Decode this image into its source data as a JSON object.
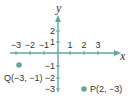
{
  "diagram": {
    "type": "coordinate-plane",
    "axes": {
      "x_label": "x",
      "y_label": "y",
      "x_ticks": [
        {
          "value": -3,
          "label": "−3"
        },
        {
          "value": -2,
          "label": "−2"
        },
        {
          "value": -1,
          "label": "−1"
        },
        {
          "value": 1,
          "label": "1"
        },
        {
          "value": 2,
          "label": "2"
        },
        {
          "value": 3,
          "label": "3"
        }
      ],
      "y_ticks": [
        {
          "value": 2,
          "label": "2"
        },
        {
          "value": 1,
          "label": "1"
        },
        {
          "value": -1,
          "label": "−1"
        },
        {
          "value": -2,
          "label": "−2"
        },
        {
          "value": -3,
          "label": "−3"
        }
      ]
    },
    "points": [
      {
        "name": "Q",
        "x": -3,
        "y": -1,
        "label": "Q(−3, −1)"
      },
      {
        "name": "P",
        "x": 2,
        "y": -3,
        "label": "P(2, −3)"
      }
    ],
    "colors": {
      "axis": "#5fa89a",
      "point": "#5fa89a",
      "text": "#333333"
    }
  }
}
